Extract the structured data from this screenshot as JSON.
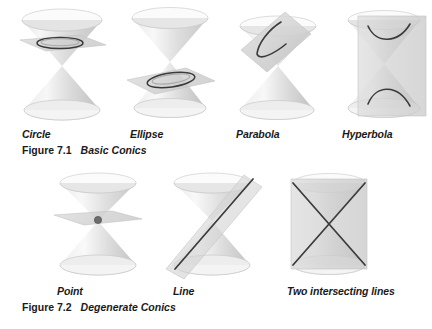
{
  "document": {
    "title": "Conic Sections Textbook Figures",
    "background_color": "#ffffff",
    "text_color": "#1a1a1a"
  },
  "palette": {
    "cone_light": "#f2f2f2",
    "cone_mid": "#d8d8d8",
    "cone_dark": "#bdbdbd",
    "cone_edge": "#c9c9c9",
    "plane_fill": "#d2d2d2",
    "plane_edge": "#c0c0c0",
    "curve_stroke": "#333333",
    "point_fill": "#6d6d6d"
  },
  "figures": [
    {
      "id": "figure-7-1",
      "number": "Figure 7.1",
      "title": "Basic Conics",
      "items": [
        {
          "id": "circle",
          "label": "Circle",
          "shape": "double-cone",
          "plane": "horizontal",
          "curve": "circle",
          "label_x": 22,
          "cone_x": 14
        },
        {
          "id": "ellipse",
          "label": "Ellipse",
          "shape": "double-cone",
          "plane": "tilted-shallow",
          "curve": "ellipse",
          "label_x": 130,
          "cone_x": 122
        },
        {
          "id": "parabola",
          "label": "Parabola",
          "shape": "double-cone",
          "plane": "tilted-parallel-to-side",
          "curve": "parabola",
          "label_x": 236,
          "cone_x": 228
        },
        {
          "id": "hyperbola",
          "label": "Hyperbola",
          "shape": "double-cone",
          "plane": "vertical",
          "curve": "hyperbola",
          "label_x": 342,
          "cone_x": 336
        }
      ]
    },
    {
      "id": "figure-7-2",
      "number": "Figure 7.2",
      "title": "Degenerate Conics",
      "items": [
        {
          "id": "point",
          "label": "Point",
          "shape": "double-cone",
          "plane": "horizontal-through-apex",
          "curve": "point",
          "label_x": 57,
          "cone_x": 50
        },
        {
          "id": "line",
          "label": "Line",
          "shape": "double-cone",
          "plane": "tangent-through-apex",
          "curve": "line",
          "label_x": 173,
          "cone_x": 158
        },
        {
          "id": "two-intersecting-lines",
          "label": "Two intersecting lines",
          "shape": "double-cone",
          "plane": "vertical-through-apex",
          "curve": "two-intersecting-lines",
          "label_x": 287,
          "cone_x": 281
        }
      ]
    }
  ]
}
